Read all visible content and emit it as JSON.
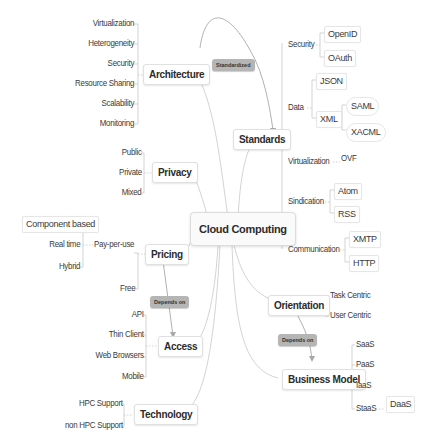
{
  "central": {
    "label": "Cloud Computing"
  },
  "relations": {
    "standardized": "Standardized",
    "pricing_access": "Depends on",
    "orientation_business": "Depends on"
  },
  "architecture": {
    "label": "Architecture",
    "children": [
      "Virtualization",
      "Heterogeneity",
      "Security",
      "Resource Sharing",
      "Scalability",
      "Monitoring"
    ]
  },
  "privacy": {
    "label": "Privacy",
    "children": [
      "Public",
      "Private",
      "Mixed"
    ]
  },
  "pricing": {
    "label": "Pricing",
    "pay_per_use": {
      "label": "Pay-per-use",
      "children": [
        "Component based",
        "Real time",
        "Hybrid"
      ]
    },
    "free": "Free"
  },
  "access": {
    "label": "Access",
    "children": [
      "API",
      "Thin Client",
      "Web Browsers",
      "Mobile"
    ]
  },
  "technology": {
    "label": "Technology",
    "children": [
      "HPC Support",
      "non HPC Support"
    ]
  },
  "standards": {
    "label": "Standards",
    "security": {
      "label": "Security",
      "children": [
        "OpenID",
        "OAuth"
      ]
    },
    "data": {
      "label": "Data",
      "json": "JSON",
      "xml": {
        "label": "XML",
        "children": [
          "SAML",
          "XACML"
        ]
      }
    },
    "virtualization": {
      "label": "Virtualization",
      "children": [
        "OVF"
      ]
    },
    "sindication": {
      "label": "Sindication",
      "children": [
        "Atom",
        "RSS"
      ]
    },
    "communication": {
      "label": "Communication",
      "children": [
        "XMTP",
        "HTTP"
      ]
    }
  },
  "orientation": {
    "label": "Orientation",
    "children": [
      "Task Centric",
      "User Centric"
    ]
  },
  "business_model": {
    "label": "Business Model",
    "children": [
      "SaaS",
      "PaaS",
      "IaaS"
    ],
    "staas": {
      "label": "StaaS",
      "children": [
        "DaaS"
      ]
    }
  }
}
